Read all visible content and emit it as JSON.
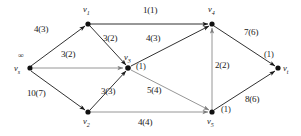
{
  "figure": {
    "type": "directed-network-flow-graph",
    "stroke_color": "#1a1a1a",
    "background": "#ffffff"
  },
  "nodes": [
    {
      "id": "vs",
      "label": "v",
      "sub": "s",
      "x": 30,
      "y": 68,
      "annotation": "∞",
      "annotation_x": 22,
      "annotation_y": 55
    },
    {
      "id": "v1",
      "label": "v",
      "sub": "1",
      "x": 88,
      "y": 24,
      "annotation": "",
      "annotation_x": 0,
      "annotation_y": 0
    },
    {
      "id": "v2",
      "label": "v",
      "sub": "2",
      "x": 88,
      "y": 112,
      "annotation": "",
      "annotation_x": 0,
      "annotation_y": 0
    },
    {
      "id": "v3",
      "label": "v",
      "sub": "3",
      "x": 128,
      "y": 68,
      "annotation": "(1)",
      "annotation_x": 140,
      "annotation_y": 66
    },
    {
      "id": "v4",
      "label": "v",
      "sub": "4",
      "x": 212,
      "y": 24,
      "annotation": "",
      "annotation_x": 0,
      "annotation_y": 0
    },
    {
      "id": "v5",
      "label": "v",
      "sub": "5",
      "x": 212,
      "y": 112,
      "annotation": "(1)",
      "annotation_x": 223,
      "annotation_y": 111
    },
    {
      "id": "vt",
      "label": "v",
      "sub": "t",
      "x": 278,
      "y": 68,
      "annotation": "(1)",
      "annotation_x": 268,
      "annotation_y": 55
    }
  ],
  "node_labels": [
    {
      "name": "node-label-vs",
      "text": "v",
      "sub": "s",
      "x": 16,
      "y": 69
    },
    {
      "name": "node-label-v1",
      "text": "v",
      "sub": "1",
      "x": 84,
      "y": 10
    },
    {
      "name": "node-label-v2",
      "text": "v",
      "sub": "2",
      "x": 84,
      "y": 119
    },
    {
      "name": "node-label-v3",
      "text": "v",
      "sub": "3",
      "x": 126,
      "y": 56
    },
    {
      "name": "node-label-v4",
      "text": "v",
      "sub": "4",
      "x": 210,
      "y": 10
    },
    {
      "name": "node-label-v5",
      "text": "v",
      "sub": "5",
      "x": 209,
      "y": 119
    },
    {
      "name": "node-label-vt",
      "text": "v",
      "sub": "t",
      "x": 283,
      "y": 69
    }
  ],
  "node_annotations": [
    {
      "name": "annotation-vs-infinity",
      "text": "∞",
      "x": 20,
      "y": 55
    },
    {
      "name": "annotation-v3-potential",
      "text": "(1)",
      "x": 137,
      "y": 64
    },
    {
      "name": "annotation-v5-potential",
      "text": "(1)",
      "x": 222,
      "y": 108
    },
    {
      "name": "annotation-vt-potential",
      "text": "(1)",
      "x": 266,
      "y": 53
    }
  ],
  "edges": [
    {
      "from": "vs",
      "to": "v1",
      "capacity": 4,
      "flow": 3,
      "label": "4(3)",
      "label_x": 36,
      "label_y": 28,
      "arrow": true
    },
    {
      "from": "vs",
      "to": "v3",
      "capacity": 3,
      "flow": 2,
      "label": "3(2)",
      "label_x": 62,
      "label_y": 54,
      "arrow": true,
      "gray": true
    },
    {
      "from": "vs",
      "to": "v2",
      "capacity": 10,
      "flow": 7,
      "label": "10(7)",
      "label_x": 30,
      "label_y": 93,
      "arrow": true
    },
    {
      "from": "v1",
      "to": "v4",
      "capacity": 1,
      "flow": 1,
      "label": "1(1)",
      "label_x": 146,
      "label_y": 9,
      "arrow": true
    },
    {
      "from": "v1",
      "to": "v3",
      "capacity": 3,
      "flow": 2,
      "label": "3(2)",
      "label_x": 104,
      "label_y": 37,
      "arrow": true
    },
    {
      "from": "v3",
      "to": "v4",
      "capacity": 4,
      "flow": 3,
      "label": "4(3)",
      "label_x": 148,
      "label_y": 37,
      "arrow": true
    },
    {
      "from": "v2",
      "to": "v3",
      "capacity": 3,
      "flow": 3,
      "label": "3(3)",
      "label_x": 102,
      "label_y": 90,
      "arrow": true
    },
    {
      "from": "v3",
      "to": "v5",
      "capacity": 5,
      "flow": 4,
      "label": "5(4)",
      "label_x": 148,
      "label_y": 89,
      "arrow": true
    },
    {
      "from": "v2",
      "to": "v5",
      "capacity": 4,
      "flow": 4,
      "label": "4(4)",
      "label_x": 140,
      "label_y": 121,
      "arrow": true
    },
    {
      "from": "v5",
      "to": "v4",
      "capacity": 2,
      "flow": 2,
      "label": "2(2)",
      "label_x": 217,
      "label_y": 64,
      "arrow": true
    },
    {
      "from": "v4",
      "to": "vt",
      "capacity": 7,
      "flow": 6,
      "label": "7(6)",
      "label_x": 246,
      "label_y": 31,
      "arrow": true
    },
    {
      "from": "v5",
      "to": "vt",
      "capacity": 8,
      "flow": 6,
      "label": "8(6)",
      "label_x": 247,
      "label_y": 98,
      "arrow": true
    }
  ],
  "edge_labels": [
    {
      "name": "edge-label-vs-v1",
      "text": "4(3)",
      "x": 34,
      "y": 27
    },
    {
      "name": "edge-label-vs-v3",
      "text": "3(2)",
      "x": 62,
      "y": 52
    },
    {
      "name": "edge-label-vs-v2",
      "text": "10(7)",
      "x": 28,
      "y": 91
    },
    {
      "name": "edge-label-v1-v4",
      "text": "1(1)",
      "x": 144,
      "y": 8
    },
    {
      "name": "edge-label-v1-v3",
      "text": "3(2)",
      "x": 104,
      "y": 36
    },
    {
      "name": "edge-label-v3-v4",
      "text": "4(3)",
      "x": 146,
      "y": 36
    },
    {
      "name": "edge-label-v2-v3",
      "text": "3(3)",
      "x": 101,
      "y": 89
    },
    {
      "name": "edge-label-v3-v5",
      "text": "5(4)",
      "x": 147,
      "y": 88
    },
    {
      "name": "edge-label-v2-v5",
      "text": "4(4)",
      "x": 139,
      "y": 120
    },
    {
      "name": "edge-label-v5-v4",
      "text": "2(2)",
      "x": 216,
      "y": 63
    },
    {
      "name": "edge-label-v4-vt",
      "text": "7(6)",
      "x": 245,
      "y": 30
    },
    {
      "name": "edge-label-v5-vt",
      "text": "8(6)",
      "x": 246,
      "y": 97
    }
  ]
}
